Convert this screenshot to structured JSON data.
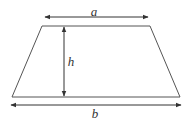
{
  "diagram": {
    "labels": {
      "top_base": "a",
      "height": "h",
      "bottom_base": "b"
    },
    "colors": {
      "stroke": "#333333",
      "background": "#ffffff"
    }
  }
}
